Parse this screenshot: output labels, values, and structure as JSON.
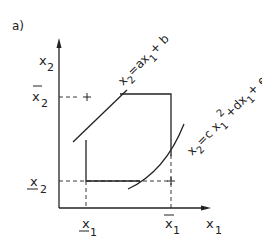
{
  "figure": {
    "panel_label": "a)",
    "axes": {
      "x_label": "x",
      "x_sub": "1",
      "y_label": "x",
      "y_sub": "2"
    },
    "ticks": {
      "x_lower": {
        "base": "x",
        "sub": "1",
        "bar": "under"
      },
      "x_upper": {
        "base": "x",
        "sub": "1",
        "bar": "over"
      },
      "y_lower": {
        "base": "x",
        "sub": "2",
        "bar": "under"
      },
      "y_upper": {
        "base": "x",
        "sub": "2",
        "bar": "over"
      }
    },
    "constraints": {
      "linear": "x2 = a x1 + b",
      "quadratic": "x2 = c x1^2 + d x1 + e"
    },
    "colors": {
      "ink": "#222222",
      "background": "#ffffff"
    }
  }
}
